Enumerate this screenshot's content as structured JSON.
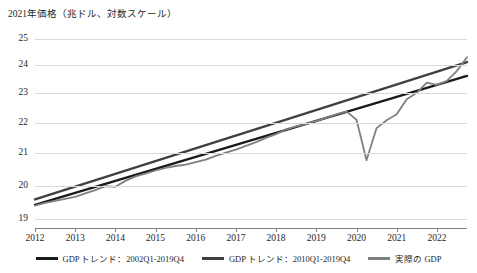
{
  "chart_data": {
    "type": "line",
    "title": "2021年価格（兆ドル、対数スケール）",
    "xlabel": "",
    "ylabel": "",
    "yscale": "log",
    "ylim": [
      18.75,
      25.4
    ],
    "yticks": [
      19,
      20,
      21,
      22,
      23,
      24,
      25
    ],
    "ytick_labels": [
      "19",
      "20",
      "21",
      "22",
      "23",
      "24",
      "25"
    ],
    "xlim": [
      2012,
      2022.75
    ],
    "xticks": [
      2012,
      2013,
      2014,
      2015,
      2016,
      2017,
      2018,
      2019,
      2020,
      2021,
      2022
    ],
    "xtick_labels": [
      "2012",
      "2013",
      "2014",
      "2015",
      "2016",
      "2017",
      "2018",
      "2019",
      "2020",
      "2021",
      "2022"
    ],
    "grid": true,
    "legend_position": "bottom",
    "series": [
      {
        "name": "GDP トレンド：2002Q1-2019Q4",
        "color": "#1a1a1a",
        "width": 2.4,
        "x": [
          2012.0,
          2022.75
        ],
        "values": [
          19.42,
          23.62
        ]
      },
      {
        "name": "GDP トレンド：2010Q1-2019Q4",
        "color": "#404040",
        "width": 2.4,
        "x": [
          2012.0,
          2022.75
        ],
        "values": [
          19.58,
          24.12
        ]
      },
      {
        "name": "実際の GDP",
        "color": "#808080",
        "width": 1.8,
        "x": [
          2012.0,
          2012.25,
          2012.5,
          2012.75,
          2013.0,
          2013.25,
          2013.5,
          2013.75,
          2014.0,
          2014.25,
          2014.5,
          2014.75,
          2015.0,
          2015.25,
          2015.5,
          2015.75,
          2016.0,
          2016.25,
          2016.5,
          2016.75,
          2017.0,
          2017.25,
          2017.5,
          2017.75,
          2018.0,
          2018.25,
          2018.5,
          2018.75,
          2019.0,
          2019.25,
          2019.5,
          2019.75,
          2020.0,
          2020.25,
          2020.5,
          2020.75,
          2021.0,
          2021.25,
          2021.5,
          2021.75,
          2022.0,
          2022.25,
          2022.5,
          2022.75
        ],
        "values": [
          19.4,
          19.48,
          19.54,
          19.6,
          19.66,
          19.76,
          19.86,
          19.98,
          19.96,
          20.14,
          20.28,
          20.36,
          20.46,
          20.54,
          20.6,
          20.64,
          20.72,
          20.8,
          20.92,
          21.02,
          21.12,
          21.24,
          21.36,
          21.5,
          21.62,
          21.78,
          21.88,
          21.96,
          22.06,
          22.16,
          22.28,
          22.38,
          22.1,
          20.78,
          21.82,
          22.08,
          22.28,
          22.8,
          23.02,
          23.38,
          23.3,
          23.44,
          23.8,
          24.3
        ]
      }
    ]
  },
  "legend": {
    "items": [
      {
        "label": "GDP トレンド：2002Q1-2019Q4",
        "color": "#1a1a1a"
      },
      {
        "label": "GDP トレンド：2010Q1-2019Q4",
        "color": "#404040"
      },
      {
        "label": "実際の GDP",
        "color": "#808080"
      }
    ]
  }
}
